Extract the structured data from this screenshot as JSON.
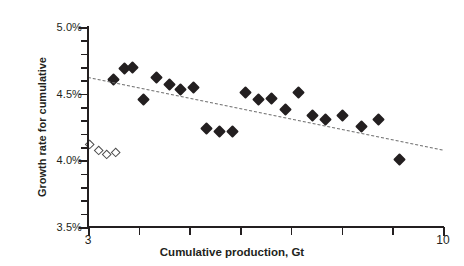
{
  "chart_data": {
    "type": "scatter",
    "title": "",
    "xlabel": "Cumulative production, Gt",
    "ylabel": "Growth rate for cumulative",
    "xlim": [
      3,
      10
    ],
    "ylim": [
      0.035,
      0.05
    ],
    "xticks": [
      3,
      4,
      5,
      6,
      7,
      8,
      9,
      10
    ],
    "xtick_labels": [
      "3",
      "",
      "",
      "",
      "",
      "",
      "",
      "10"
    ],
    "yticks": [
      0.035,
      0.04,
      0.045,
      0.05
    ],
    "ytick_labels": [
      "3.5%",
      "4.0%",
      "4.5%",
      "5.0%"
    ],
    "y_minor_step": 0.001,
    "grid": false,
    "legend": null,
    "series": [
      {
        "name": "filled-diamonds",
        "marker": "filled-diamond",
        "color": "#231f20",
        "points": [
          {
            "x": 3.5,
            "y": 0.04605
          },
          {
            "x": 3.72,
            "y": 0.0469
          },
          {
            "x": 3.88,
            "y": 0.04695
          },
          {
            "x": 4.1,
            "y": 0.04455
          },
          {
            "x": 4.36,
            "y": 0.0462
          },
          {
            "x": 4.6,
            "y": 0.0457
          },
          {
            "x": 4.82,
            "y": 0.04535
          },
          {
            "x": 5.08,
            "y": 0.04545
          },
          {
            "x": 5.34,
            "y": 0.0424
          },
          {
            "x": 5.6,
            "y": 0.04215
          },
          {
            "x": 5.84,
            "y": 0.04215
          },
          {
            "x": 6.1,
            "y": 0.0451
          },
          {
            "x": 6.36,
            "y": 0.04455
          },
          {
            "x": 6.62,
            "y": 0.04465
          },
          {
            "x": 6.9,
            "y": 0.04385
          },
          {
            "x": 7.16,
            "y": 0.0451
          },
          {
            "x": 7.42,
            "y": 0.0434
          },
          {
            "x": 7.68,
            "y": 0.04305
          },
          {
            "x": 8.02,
            "y": 0.0434
          },
          {
            "x": 8.4,
            "y": 0.04255
          },
          {
            "x": 8.72,
            "y": 0.04305
          },
          {
            "x": 9.14,
            "y": 0.0401
          }
        ]
      },
      {
        "name": "open-diamonds",
        "marker": "open-diamond",
        "color": "#4d4d4d",
        "points": [
          {
            "x": 3.04,
            "y": 0.0412
          },
          {
            "x": 3.22,
            "y": 0.0407
          },
          {
            "x": 3.36,
            "y": 0.0404
          },
          {
            "x": 3.54,
            "y": 0.04055
          }
        ]
      }
    ],
    "trendline": {
      "name": "linear-trend",
      "style": "dashed",
      "color": "#6e6e6e",
      "x_start": 3.0,
      "y_start": 0.04625,
      "x_end": 10.0,
      "y_end": 0.0408
    }
  }
}
